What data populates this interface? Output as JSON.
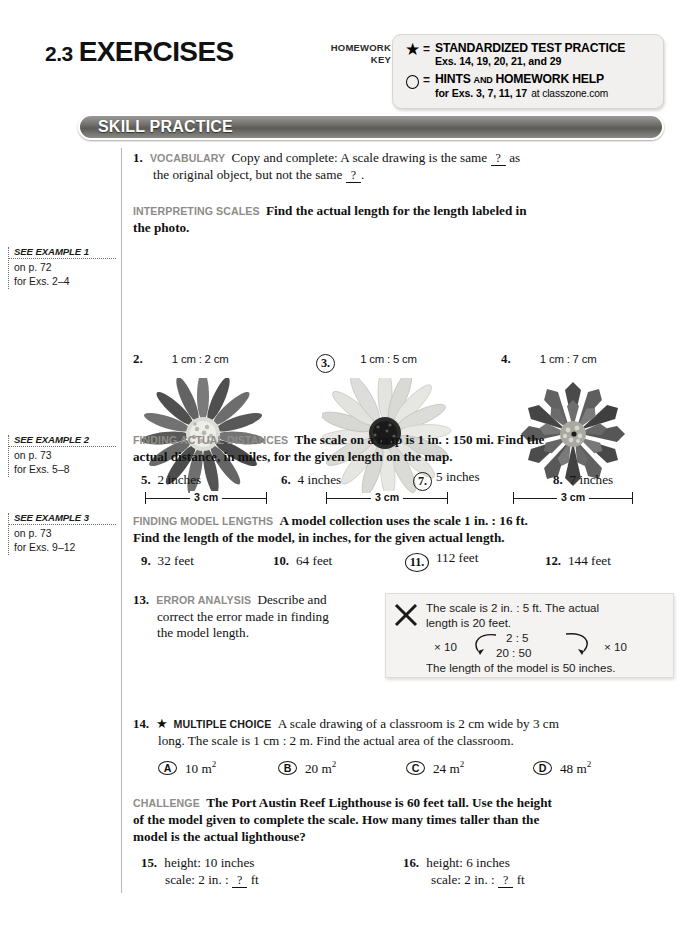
{
  "header": {
    "lesson_number": "2.3",
    "lesson_word": "EXERCISES",
    "homework_key_label_line1": "HOMEWORK",
    "homework_key_label_line2": "KEY",
    "key_rows": [
      {
        "glyph": "star-icon",
        "equals": "=",
        "title": "STANDARDIZED TEST PRACTICE",
        "detail": "Exs. 14, 19, 20, 21, and 29"
      },
      {
        "glyph": "circle-icon",
        "equals": "=",
        "title_a": "HINTS",
        "title_and": "AND",
        "title_b": "HOMEWORK HELP",
        "detail_bold": "for Exs. 3, 7, 11, 17",
        "detail_light": "at classzone.com"
      }
    ]
  },
  "banner": {
    "label": "SKILL PRACTICE"
  },
  "gutter": [
    {
      "title": "SEE EXAMPLE 1",
      "line1": "on p. 72",
      "line2": "for Exs. 2–4"
    },
    {
      "title": "SEE EXAMPLE 2",
      "line1": "on p. 73",
      "line2": "for Exs. 5–8"
    },
    {
      "title": "SEE EXAMPLE 3",
      "line1": "on p. 73",
      "line2": "for Exs. 9–12"
    }
  ],
  "ex1": {
    "number": "1.",
    "tag": "VOCABULARY",
    "text_a": "Copy and complete: A scale drawing is the same",
    "blank1": "?",
    "text_b": "as",
    "text_c": "the original object, but not the same",
    "blank2": "?",
    "text_d": "."
  },
  "interpreting": {
    "tag": "INTERPRETING SCALES",
    "line1": "Find the actual length for the length labeled in",
    "line2": "the photo."
  },
  "flowers": [
    {
      "number": "2.",
      "circled": false,
      "scale": "1 cm : 2 cm",
      "ruler_label": "3 cm",
      "photo": "zinnia-flower-photo"
    },
    {
      "number": "3.",
      "circled": true,
      "scale": "1 cm : 5 cm",
      "ruler_label": "3 cm",
      "photo": "daisy-flower-photo"
    },
    {
      "number": "4.",
      "circled": false,
      "scale": "1 cm : 7 cm",
      "ruler_label": "3 cm",
      "photo": "dahlia-flower-photo"
    }
  ],
  "finding_distances": {
    "tag": "FINDING ACTUAL DISTANCES",
    "line1": "The scale on a map is 1 in. : 150 mi. Find the",
    "line2": "actual distance, in miles, for the given length on the map.",
    "items": [
      {
        "number": "5.",
        "circled": false,
        "text": "2 inches"
      },
      {
        "number": "6.",
        "circled": false,
        "text": "4 inches"
      },
      {
        "number": "7.",
        "circled": true,
        "text": "5 inches"
      },
      {
        "number": "8.",
        "circled": false,
        "text": "7 inches"
      }
    ]
  },
  "finding_models": {
    "tag": "FINDING MODEL LENGTHS",
    "line1": "A model collection uses the scale 1 in. : 16 ft.",
    "line2": "Find the length of the model, in inches, for the given actual length.",
    "items": [
      {
        "number": "9.",
        "circled": false,
        "text": "32 feet"
      },
      {
        "number": "10.",
        "circled": false,
        "text": "64 feet"
      },
      {
        "number": "11.",
        "circled": true,
        "text": "112 feet"
      },
      {
        "number": "12.",
        "circled": false,
        "text": "144 feet"
      }
    ]
  },
  "ex13": {
    "number": "13.",
    "tag": "ERROR ANALYSIS",
    "line1": "Describe and",
    "line2": "correct the error made in finding",
    "line3": "the model length.",
    "work": {
      "icon": "x-mark-icon",
      "line1": "The scale is 2 in. : 5 ft. The actual",
      "line2": "length is 20 feet.",
      "left_mult": "× 10",
      "ratio_top": "2 : 5",
      "ratio_bottom": "20 : 50",
      "right_mult": "× 10",
      "conclusion": "The length of the model is 50 inches."
    }
  },
  "ex14": {
    "number": "14.",
    "star": "★",
    "tag": "MULTIPLE CHOICE",
    "line1": "A scale drawing of a classroom is 2 cm wide by 3 cm",
    "line2": "long. The scale is 1 cm : 2 m. Find the actual area of the classroom.",
    "choices": [
      {
        "letter": "A",
        "value": "10 m",
        "exp": "2"
      },
      {
        "letter": "B",
        "value": "20 m",
        "exp": "2"
      },
      {
        "letter": "C",
        "value": "24 m",
        "exp": "2"
      },
      {
        "letter": "D",
        "value": "48 m",
        "exp": "2"
      }
    ]
  },
  "challenge": {
    "tag": "CHALLENGE",
    "line1": "The Port Austin Reef Lighthouse is 60 feet tall. Use the height",
    "line2": "of the model given to complete the scale. How many times taller than the",
    "line3": "model is the actual lighthouse?",
    "items": [
      {
        "number": "15.",
        "line1": "height: 10 inches",
        "scale_pre": "scale: 2 in. :",
        "blank": "?",
        "scale_post": "ft"
      },
      {
        "number": "16.",
        "line1": "height: 6 inches",
        "scale_pre": "scale: 2 in. :",
        "blank": "?",
        "scale_post": "ft"
      }
    ]
  }
}
